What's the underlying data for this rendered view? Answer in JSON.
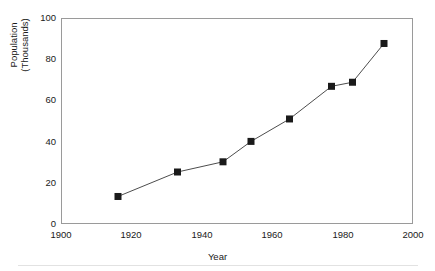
{
  "chart_data": {
    "type": "line",
    "title": "",
    "xlabel": "Year",
    "ylabel": "Population (Thousands)",
    "ylabel_lines": [
      "Population",
      "(Thousands)"
    ],
    "x": [
      1916,
      1933,
      1946,
      1954,
      1965,
      1977,
      1983,
      1992
    ],
    "values": [
      13,
      25,
      30,
      40,
      51,
      67,
      69,
      88
    ],
    "series": [
      {
        "name": "Population",
        "x": [
          1916,
          1933,
          1946,
          1954,
          1965,
          1977,
          1983,
          1992
        ],
        "values": [
          13,
          25,
          30,
          40,
          51,
          67,
          69,
          88
        ]
      }
    ],
    "xlim": [
      1900,
      2000
    ],
    "ylim": [
      0,
      100
    ],
    "xticks": [
      1900,
      1920,
      1940,
      1960,
      1980,
      2000
    ],
    "yticks": [
      0,
      20,
      40,
      60,
      80,
      100
    ],
    "xtick_labels": [
      "1900",
      "1920",
      "1940",
      "1960",
      "1980",
      "2000"
    ],
    "ytick_labels": [
      "0",
      "20",
      "40",
      "60",
      "80",
      "100"
    ],
    "grid": false,
    "legend": false,
    "legend_position": "none",
    "marker": "square",
    "marker_color": "#1a1a1a",
    "line_color": "#4d4d4d",
    "axis_color": "#9a9a9a",
    "background_color": "#ffffff"
  }
}
